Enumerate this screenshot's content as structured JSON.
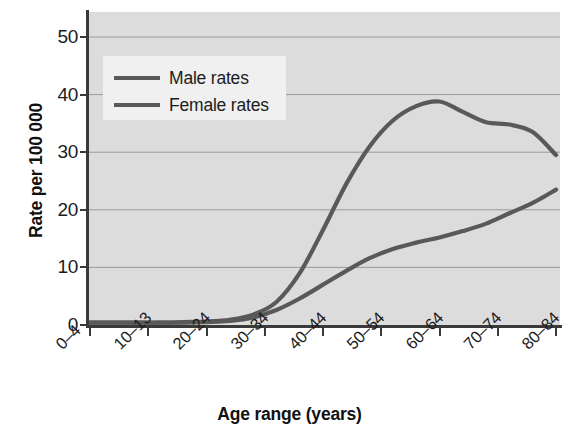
{
  "chart_data": {
    "type": "line",
    "title": "",
    "xlabel": "Age range (years)",
    "ylabel": "Rate per 100 000",
    "categories": [
      "0–4",
      "10–13",
      "20–24",
      "30–34",
      "40–44",
      "50–54",
      "60–64",
      "70–74",
      "80–84"
    ],
    "x_tick_labels": [
      "0–4",
      "10–13",
      "20–24",
      "30–34",
      "40–44",
      "50–54",
      "60–64",
      "70–74",
      "80–84"
    ],
    "y_tick_labels": [
      "0",
      "10",
      "20",
      "30",
      "40",
      "50"
    ],
    "y_tick_values": [
      0,
      10,
      20,
      30,
      40,
      50
    ],
    "ylim": [
      0,
      53
    ],
    "grid": "horizontal",
    "legend_position": "upper-left-inside",
    "series": [
      {
        "name": "Male rates",
        "color": "#595959",
        "values": [
          0.4,
          0.4,
          0.5,
          1.2,
          9.0,
          28.0,
          38.5,
          35.0,
          29.5
        ]
      },
      {
        "name": "Female rates",
        "color": "#595959",
        "values": [
          0.4,
          0.4,
          0.4,
          0.8,
          4.5,
          11.5,
          14.5,
          18.0,
          23.5
        ]
      }
    ],
    "series_dense": {
      "x": [
        0,
        5,
        10,
        15,
        20,
        25,
        30,
        35,
        40,
        45,
        50,
        55,
        60,
        65,
        70,
        75,
        80,
        85,
        90,
        95,
        100
      ],
      "male": [
        0.4,
        0.4,
        0.4,
        0.4,
        0.5,
        0.6,
        0.9,
        1.8,
        4.0,
        9.0,
        16.5,
        24.5,
        31.0,
        35.5,
        38.0,
        38.8,
        37.0,
        35.2,
        34.8,
        33.5,
        29.5
      ],
      "female": [
        0.4,
        0.4,
        0.4,
        0.4,
        0.4,
        0.5,
        0.7,
        1.3,
        2.6,
        4.6,
        7.0,
        9.4,
        11.6,
        13.2,
        14.3,
        15.2,
        16.3,
        17.6,
        19.4,
        21.2,
        23.5
      ]
    },
    "colors": {
      "plot_background": "#dcdcdc",
      "gridline": "#9a9a9a",
      "axis": "#3a3a3a",
      "line": "#595959",
      "legend_background": "#f0f0f0",
      "text": "#1c1c1c"
    }
  },
  "legend": {
    "items": [
      {
        "label": "Male rates"
      },
      {
        "label": "Female rates"
      }
    ]
  }
}
